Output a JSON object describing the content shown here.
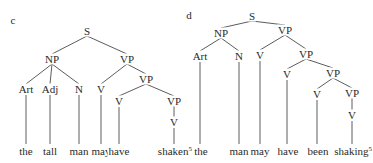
{
  "diagrams": [
    {
      "panel_label": "c",
      "sentence": "the tall man may have shaken",
      "footnote": "5",
      "nodes": [
        {
          "id": "S",
          "label": "S",
          "x": 87,
          "y": 31
        },
        {
          "id": "NP",
          "label": "NP",
          "x": 52,
          "y": 59
        },
        {
          "id": "VP1",
          "label": "VP",
          "x": 127,
          "y": 59
        },
        {
          "id": "Art",
          "label": "Art",
          "x": 26,
          "y": 89
        },
        {
          "id": "Adj",
          "label": "Adj",
          "x": 50,
          "y": 89
        },
        {
          "id": "N",
          "label": "N",
          "x": 79,
          "y": 89
        },
        {
          "id": "V1",
          "label": "V",
          "x": 101,
          "y": 89
        },
        {
          "id": "VP2",
          "label": "VP",
          "x": 146,
          "y": 79
        },
        {
          "id": "V2",
          "label": "V",
          "x": 119,
          "y": 101
        },
        {
          "id": "VP3",
          "label": "VP",
          "x": 174,
          "y": 101
        },
        {
          "id": "V3",
          "label": "V",
          "x": 174,
          "y": 122
        }
      ],
      "edges": [
        [
          "S",
          "NP"
        ],
        [
          "S",
          "VP1"
        ],
        [
          "NP",
          "Art"
        ],
        [
          "NP",
          "Adj"
        ],
        [
          "NP",
          "N"
        ],
        [
          "VP1",
          "V1"
        ],
        [
          "VP1",
          "VP2"
        ],
        [
          "VP2",
          "V2"
        ],
        [
          "VP2",
          "VP3"
        ],
        [
          "VP3",
          "V3"
        ]
      ],
      "words": [
        {
          "text": "the",
          "x": 26,
          "attach": "Art"
        },
        {
          "text": "tall",
          "x": 50,
          "attach": "Adj"
        },
        {
          "text": "man",
          "x": 79,
          "attach": "N"
        },
        {
          "text": "may",
          "x": 101,
          "attach": "V1"
        },
        {
          "text": "have",
          "x": 119,
          "attach": "V2"
        },
        {
          "text": "shaken",
          "x": 172,
          "attach": "V3"
        }
      ],
      "label_pos": {
        "x": 13,
        "y": 20
      },
      "word_y": 151
    },
    {
      "panel_label": "d",
      "sentence": "the man may have been shaking",
      "footnote": "5",
      "nodes": [
        {
          "id": "S",
          "label": "S",
          "x": 252,
          "y": 16
        },
        {
          "id": "NP",
          "label": "NP",
          "x": 221,
          "y": 33
        },
        {
          "id": "VP1",
          "label": "VP",
          "x": 285,
          "y": 30
        },
        {
          "id": "Art",
          "label": "Art",
          "x": 200,
          "y": 56
        },
        {
          "id": "N",
          "label": "N",
          "x": 239,
          "y": 56
        },
        {
          "id": "V1",
          "label": "V",
          "x": 260,
          "y": 55
        },
        {
          "id": "VP2",
          "label": "VP",
          "x": 306,
          "y": 54
        },
        {
          "id": "V2",
          "label": "V",
          "x": 287,
          "y": 74
        },
        {
          "id": "VP3",
          "label": "VP",
          "x": 333,
          "y": 73
        },
        {
          "id": "V3",
          "label": "V",
          "x": 317,
          "y": 94
        },
        {
          "id": "VP4",
          "label": "VP",
          "x": 352,
          "y": 93
        },
        {
          "id": "V4",
          "label": "V",
          "x": 352,
          "y": 115
        }
      ],
      "edges": [
        [
          "S",
          "NP"
        ],
        [
          "S",
          "VP1"
        ],
        [
          "NP",
          "Art"
        ],
        [
          "NP",
          "N"
        ],
        [
          "VP1",
          "V1"
        ],
        [
          "VP1",
          "VP2"
        ],
        [
          "VP2",
          "V2"
        ],
        [
          "VP2",
          "VP3"
        ],
        [
          "VP3",
          "V3"
        ],
        [
          "VP3",
          "VP4"
        ],
        [
          "VP4",
          "V4"
        ]
      ],
      "words": [
        {
          "text": "the",
          "x": 201,
          "attach": "Art"
        },
        {
          "text": "man",
          "x": 239,
          "attach": "N"
        },
        {
          "text": "may",
          "x": 260,
          "attach": "V1"
        },
        {
          "text": "have",
          "x": 288,
          "attach": "V2"
        },
        {
          "text": "been",
          "x": 318,
          "attach": "V3"
        },
        {
          "text": "shaking",
          "x": 350,
          "attach": "V4"
        }
      ],
      "label_pos": {
        "x": 189,
        "y": 15
      },
      "word_y": 151
    }
  ],
  "colors": {
    "ink": "#2a2a2a",
    "line": "#4a4a4a",
    "paper": "#ffffff"
  }
}
